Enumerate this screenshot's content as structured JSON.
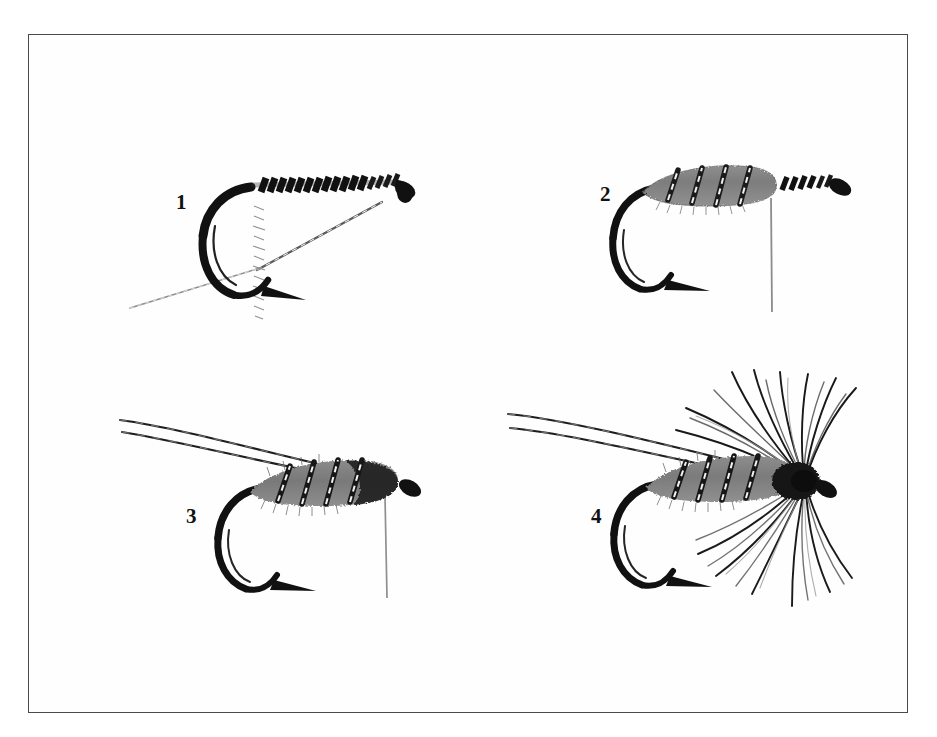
{
  "figure": {
    "background_color": "#ffffff",
    "border_color": "#4a4a4a",
    "ink_color": "#111111",
    "body_gray": "#808080",
    "rib_silver": "#e8e8e8",
    "panel_count": 4
  },
  "panels": [
    {
      "id": "panel-1",
      "number": "1",
      "number_x": 176,
      "number_y": 192,
      "step_name": "hook-with-thread-base-and-rib",
      "elements": [
        "hook",
        "thread-wraps-on-shank",
        "hanging-herl-strand",
        "tinsel-rib-tag"
      ]
    },
    {
      "id": "panel-2",
      "number": "2",
      "number_x": 603,
      "number_y": 186,
      "step_name": "dubbed-body-with-rib",
      "elements": [
        "hook",
        "dubbed-gray-body",
        "ribbing-turns",
        "hanging-thread"
      ]
    },
    {
      "id": "panel-3",
      "number": "3",
      "number_x": 186,
      "number_y": 506,
      "step_name": "tail-fibers-added",
      "elements": [
        "hook",
        "dubbed-gray-body",
        "ribbing-turns",
        "tail-fibers",
        "hanging-thread"
      ]
    },
    {
      "id": "panel-4",
      "number": "4",
      "number_x": 591,
      "number_y": 506,
      "step_name": "soft-hackle-collar-finished-fly",
      "elements": [
        "hook",
        "dubbed-gray-body",
        "ribbing-turns",
        "tail-fibers",
        "soft-hackle-collar",
        "head"
      ]
    }
  ]
}
